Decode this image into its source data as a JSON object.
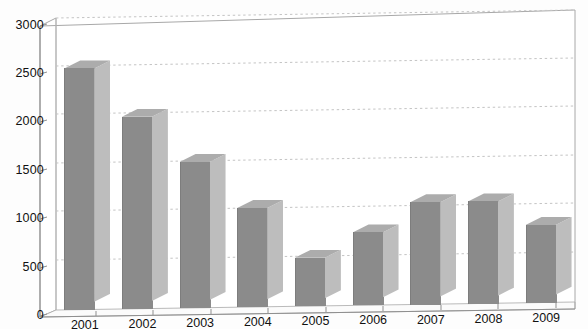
{
  "chart_data": {
    "type": "bar",
    "title": "",
    "subtitle": "",
    "xlabel": "",
    "ylabel": "",
    "categories": [
      "2001",
      "2002",
      "2003",
      "2004",
      "2005",
      "2006",
      "2007",
      "2008",
      "2009"
    ],
    "values": [
      2480,
      1975,
      1500,
      1020,
      500,
      750,
      1050,
      1050,
      800
    ],
    "series": [
      {
        "name": "",
        "values": [
          2480,
          1975,
          1500,
          1020,
          500,
          750,
          1050,
          1050,
          800
        ]
      }
    ],
    "ylim": [
      0,
      3000
    ],
    "ytick_labels": [
      "3000",
      "2500",
      "2000",
      "1500",
      "1000",
      "500",
      "0"
    ],
    "ytick_values": [
      3000,
      2500,
      2000,
      1500,
      1000,
      500,
      0
    ],
    "grid": true,
    "grid_style": "dotted-horizontal",
    "legend": "none",
    "render_style": "3d-bar",
    "colors": {
      "bar_front": "#8b8b8b",
      "bar_side": "#bdbdbd",
      "bar_top": "#acacac",
      "gridline": "#c9c9c9",
      "frame": "#9a9a9a",
      "text": "#111111",
      "background": "#fdfdfd"
    }
  },
  "axes": {
    "y_ticks": [
      {
        "label": "3000",
        "value": 3000
      },
      {
        "label": "2500",
        "value": 2500
      },
      {
        "label": "2000",
        "value": 2000
      },
      {
        "label": "1500",
        "value": 1500
      },
      {
        "label": "1000",
        "value": 1000
      },
      {
        "label": "500",
        "value": 500
      },
      {
        "label": "0",
        "value": 0
      }
    ],
    "x_ticks": [
      {
        "label": "2001"
      },
      {
        "label": "2002"
      },
      {
        "label": "2003"
      },
      {
        "label": "2004"
      },
      {
        "label": "2005"
      },
      {
        "label": "2006"
      },
      {
        "label": "2007"
      },
      {
        "label": "2008"
      },
      {
        "label": "2009"
      }
    ]
  }
}
